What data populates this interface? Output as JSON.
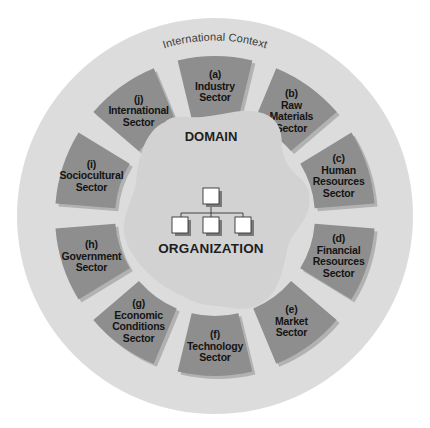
{
  "diagram": {
    "context_label": "International Context",
    "domain_label": "DOMAIN",
    "organization_label": "ORGANIZATION",
    "org_chart": {
      "top_boxes": 1,
      "bottom_boxes": 3
    },
    "colors": {
      "background": "#ffffff",
      "outer_circle": "#dcdcdc",
      "sector_fill": "#8e8e8e",
      "sector_shadow": "#b2b2b2",
      "domain_blob": "#d2d2d2",
      "org_box_fill": "#ffffff",
      "org_box_stroke": "#333333",
      "text": "#141414"
    },
    "sectors": [
      {
        "id": "a",
        "letter": "(a)",
        "lines": [
          "Industry",
          "Sector"
        ]
      },
      {
        "id": "b",
        "letter": "(b)",
        "lines": [
          "Raw",
          "Materials",
          "Sector"
        ]
      },
      {
        "id": "c",
        "letter": "(c)",
        "lines": [
          "Human",
          "Resources",
          "Sector"
        ]
      },
      {
        "id": "d",
        "letter": "(d)",
        "lines": [
          "Financial",
          "Resources",
          "Sector"
        ]
      },
      {
        "id": "e",
        "letter": "(e)",
        "lines": [
          "Market",
          "Sector"
        ]
      },
      {
        "id": "f",
        "letter": "(f)",
        "lines": [
          "Technology",
          "Sector"
        ]
      },
      {
        "id": "g",
        "letter": "(g)",
        "lines": [
          "Economic",
          "Conditions",
          "Sector"
        ]
      },
      {
        "id": "h",
        "letter": "(h)",
        "lines": [
          "Government",
          "Sector"
        ]
      },
      {
        "id": "i",
        "letter": "(i)",
        "lines": [
          "Sociocultural",
          "Sector"
        ]
      },
      {
        "id": "j",
        "letter": "(j)",
        "lines": [
          "International",
          "Sector"
        ]
      }
    ]
  }
}
